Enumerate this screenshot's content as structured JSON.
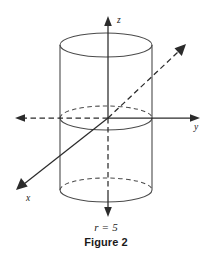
{
  "figure": {
    "type": "3d-coordinate-diagram",
    "background_color": "#ffffff",
    "line_color": "#2b2b2b",
    "cylinder_color": "#4a4a4a",
    "radius_caption": "r = 5",
    "figure_caption": "Figure 2",
    "axes": [
      {
        "name": "z-axis",
        "label": "z",
        "label_position": "top",
        "positive_style": "solid",
        "negative_style": "dashed-then-solid",
        "has_arrow_positive": true,
        "has_arrow_negative": true
      },
      {
        "name": "y-axis",
        "label": "y",
        "label_position": "right",
        "positive_style": "solid",
        "negative_style": "dashed",
        "has_arrow_positive": true,
        "has_arrow_negative": true
      },
      {
        "name": "x-axis",
        "label": "x",
        "label_position": "lower-left",
        "positive_style": "dashed",
        "negative_style": "solid",
        "has_arrow_positive": true,
        "has_arrow_negative": true
      }
    ],
    "solid": {
      "shape": "cylinder",
      "axis": "z",
      "radius_value": 5,
      "top_ellipse": "solid",
      "middle_ellipse": "front-solid-back-dashed",
      "bottom_ellipse": "front-solid-back-dashed"
    }
  }
}
